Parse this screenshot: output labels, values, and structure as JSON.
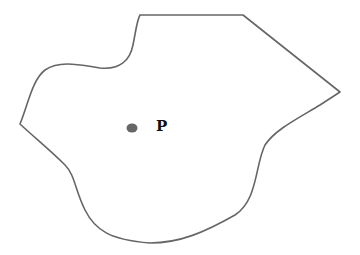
{
  "diagram": {
    "outline_color": "#666666",
    "point": {
      "label": "P",
      "color": "#666666",
      "x": 132,
      "y": 128
    }
  }
}
